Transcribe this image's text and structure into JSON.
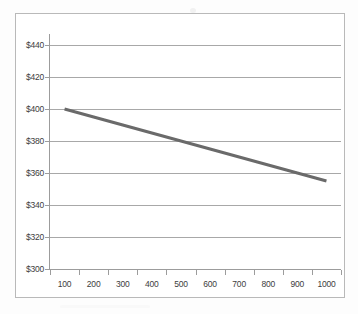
{
  "chart_data": {
    "type": "line",
    "title": "",
    "subtitle": "",
    "xlabel": "",
    "ylabel": "",
    "grid": true,
    "grid_orientation": "horizontal",
    "legend": false,
    "legend_position": "none",
    "xlim": [
      100,
      1000
    ],
    "ylim": [
      300,
      440
    ],
    "y_tick_step": 20,
    "x_tick_step": 100,
    "y_tick_format": "$0",
    "categories": [
      100,
      200,
      300,
      400,
      500,
      600,
      700,
      800,
      900,
      1000
    ],
    "x_tick_labels": [
      "100",
      "200",
      "300",
      "400",
      "500",
      "600",
      "700",
      "800",
      "900",
      "1000"
    ],
    "y_tick_labels": [
      "$300",
      "$320",
      "$340",
      "$360",
      "$380",
      "$400",
      "$420",
      "$440"
    ],
    "y_tick_values": [
      300,
      320,
      340,
      360,
      380,
      400,
      420,
      440
    ],
    "series": [
      {
        "name": "",
        "color": "#6a6a6a",
        "line_width": 3,
        "markers": false,
        "values": [
          400,
          395,
          390,
          385,
          380,
          375,
          370,
          365,
          360,
          355
        ]
      }
    ],
    "annotations": []
  },
  "axes": {
    "y_axis_name": "value-axis",
    "x_axis_name": "category-axis"
  }
}
